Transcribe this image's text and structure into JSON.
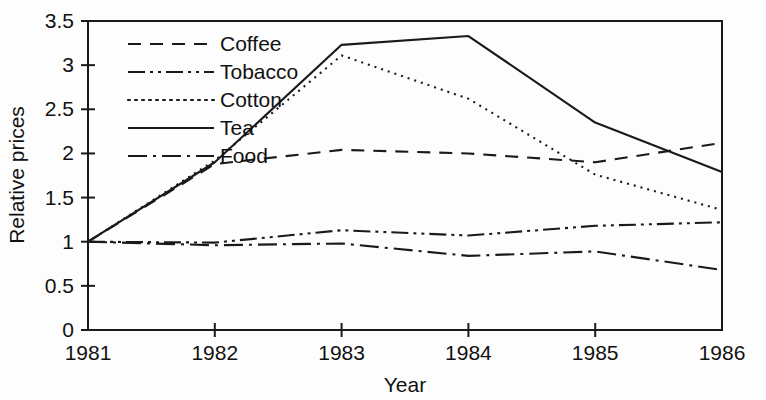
{
  "chart_data": {
    "type": "line",
    "title": "",
    "xlabel": "Year",
    "ylabel": "Relative prices",
    "x": [
      1981,
      1982,
      1983,
      1984,
      1985,
      1986
    ],
    "xtick_labels": [
      "1981",
      "1982",
      "1983",
      "1984",
      "1985",
      "1986"
    ],
    "ytick_labels": [
      "0",
      "0.5",
      "1",
      "1.5",
      "2",
      "2.5",
      "3",
      "3.5"
    ],
    "ytick_values": [
      0,
      0.5,
      1,
      1.5,
      2,
      2.5,
      3,
      3.5
    ],
    "xlim": [
      1981,
      1986
    ],
    "ylim": [
      0,
      3.5
    ],
    "grid": false,
    "legend_position": "upper-left-inside",
    "series": [
      {
        "name": "Coffee",
        "style": "dashed",
        "dasharray": "13,9",
        "values": [
          1.0,
          1.88,
          2.04,
          2.0,
          1.9,
          2.12
        ]
      },
      {
        "name": "Tobacco",
        "style": "dash-dot-dot",
        "dasharray": "17,5,3,5,3,5",
        "values": [
          1.0,
          0.99,
          1.13,
          1.07,
          1.18,
          1.22
        ]
      },
      {
        "name": "Cotton",
        "style": "dotted",
        "dasharray": "2,5",
        "values": [
          1.0,
          1.92,
          3.11,
          2.62,
          1.76,
          1.36
        ]
      },
      {
        "name": "Tea",
        "style": "solid",
        "dasharray": "none",
        "values": [
          1.0,
          1.9,
          3.23,
          3.33,
          2.35,
          1.79
        ]
      },
      {
        "name": "Food",
        "style": "dash-dot",
        "dasharray": "19,6,3,6",
        "values": [
          1.0,
          0.96,
          0.98,
          0.84,
          0.89,
          0.68
        ]
      }
    ]
  },
  "colors": {
    "ink": "#1a1a1a",
    "background": "#fdfdfd"
  }
}
